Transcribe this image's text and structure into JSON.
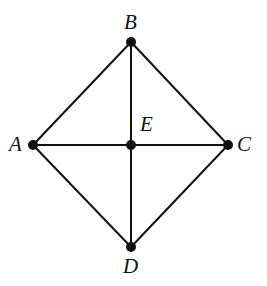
{
  "figure": {
    "kind": "graph-diagram",
    "caption": "",
    "background_color": "#ffffff",
    "stroke_color": "#111111",
    "vertex_color": "#111111",
    "edge_width_px": 2,
    "vertex_radius_px": 5,
    "width_px": 267,
    "height_px": 286
  },
  "labels": {
    "a": "A",
    "b": "B",
    "c": "C",
    "d": "D",
    "e": "E"
  },
  "chart_data": {
    "type": "diagram",
    "title": "",
    "nodes": [
      {
        "id": "A",
        "label": "A",
        "x": 33,
        "y": 145,
        "label_x": 14,
        "label_y": 147,
        "label_anchor": "left-of-node"
      },
      {
        "id": "B",
        "label": "B",
        "x": 131,
        "y": 42,
        "label_x": 131,
        "label_y": 22,
        "label_anchor": "above-node"
      },
      {
        "id": "C",
        "label": "C",
        "x": 228,
        "y": 145,
        "label_x": 245,
        "label_y": 147,
        "label_anchor": "right-of-node"
      },
      {
        "id": "D",
        "label": "D",
        "x": 131,
        "y": 247,
        "label_x": 131,
        "label_y": 267,
        "label_anchor": "below-node"
      },
      {
        "id": "E",
        "label": "E",
        "x": 131,
        "y": 145,
        "label_x": 147,
        "label_y": 124,
        "label_anchor": "above-right-of-node"
      }
    ],
    "edges": [
      {
        "from": "A",
        "to": "B"
      },
      {
        "from": "B",
        "to": "C"
      },
      {
        "from": "C",
        "to": "D"
      },
      {
        "from": "D",
        "to": "A"
      },
      {
        "from": "A",
        "to": "E"
      },
      {
        "from": "E",
        "to": "C"
      },
      {
        "from": "B",
        "to": "E"
      },
      {
        "from": "E",
        "to": "D"
      }
    ],
    "node_count": 5,
    "edge_count": 8,
    "xlabel": "",
    "ylabel": "",
    "grid": false,
    "legend": false
  }
}
